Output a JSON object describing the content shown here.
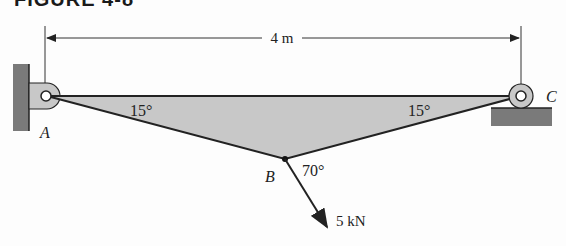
{
  "figure": {
    "header": "FIGURE 4-8",
    "dimension_label": "4 m",
    "angle_A": "15°",
    "angle_C": "15°",
    "angle_B": "70°",
    "point_A": "A",
    "point_B": "B",
    "point_C": "C",
    "force_label": "5 kN",
    "colors": {
      "fill": "#c8c8c8",
      "support": "#7a7a7a",
      "line": "#222222"
    }
  }
}
